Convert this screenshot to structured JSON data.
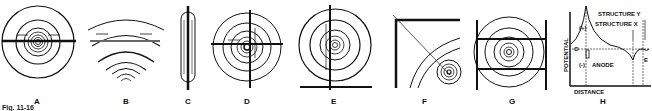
{
  "figure": {
    "caption": "Fig. 11-16",
    "panels": [
      {
        "id": "A",
        "label": "A"
      },
      {
        "id": "B",
        "label": "B"
      },
      {
        "id": "C",
        "label": "C"
      },
      {
        "id": "D",
        "label": "D"
      },
      {
        "id": "E",
        "label": "E"
      },
      {
        "id": "F",
        "label": "F"
      },
      {
        "id": "G",
        "label": "G"
      },
      {
        "id": "H",
        "label": "H"
      }
    ],
    "graph_h": {
      "y_axis_label": "POTENTIAL",
      "x_axis_label": "DISTANCE",
      "plus": "(+)",
      "minus": "(-)",
      "zero": "O",
      "anode": "ANODE",
      "structure_y": "STRUCTURE Y",
      "structure_x": "STRUCTURE X",
      "e_label": "E"
    }
  }
}
